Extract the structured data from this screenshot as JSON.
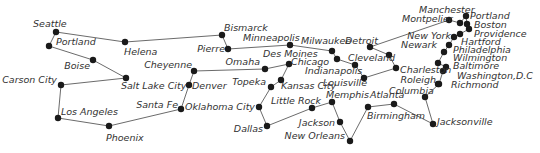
{
  "map": {
    "type": "city-graph",
    "colors": {
      "edge": "#6b6b6b",
      "node": "#1a1a1a",
      "label": "#333333",
      "background": "#ffffff"
    },
    "nodes": [
      {
        "id": "seattle",
        "label": "Seattle",
        "x": 56,
        "y": 32,
        "lx": 33,
        "ly": 27,
        "anchor": "start"
      },
      {
        "id": "portland_or",
        "label": "Portland",
        "x": 49,
        "y": 46,
        "lx": 56,
        "ly": 45,
        "anchor": "start"
      },
      {
        "id": "helena",
        "label": "Helena",
        "x": 125,
        "y": 42,
        "lx": 124,
        "ly": 55,
        "anchor": "start"
      },
      {
        "id": "bismarck",
        "label": "Bismarck",
        "x": 222,
        "y": 35,
        "lx": 224,
        "ly": 31,
        "anchor": "start"
      },
      {
        "id": "pierre",
        "label": "Pierre",
        "x": 228,
        "y": 49,
        "lx": 225,
        "ly": 52,
        "anchor": "end"
      },
      {
        "id": "boise",
        "label": "Boise",
        "x": 93,
        "y": 60,
        "lx": 90,
        "ly": 69,
        "anchor": "end"
      },
      {
        "id": "salt_lake_city",
        "label": "Salt Lake City",
        "x": 126,
        "y": 78,
        "lx": 121,
        "ly": 89,
        "anchor": "start"
      },
      {
        "id": "carson_city",
        "label": "Carson City",
        "x": 61,
        "y": 85,
        "lx": 57,
        "ly": 83,
        "anchor": "end"
      },
      {
        "id": "los_angeles",
        "label": "Los Angeles",
        "x": 58,
        "y": 118,
        "lx": 61,
        "ly": 115,
        "anchor": "start"
      },
      {
        "id": "phoenix",
        "label": "Phoenix",
        "x": 109,
        "y": 126,
        "lx": 106,
        "ly": 141,
        "anchor": "start"
      },
      {
        "id": "santa_fe",
        "label": "Santa Fe",
        "x": 181,
        "y": 109,
        "lx": 178,
        "ly": 108,
        "anchor": "end"
      },
      {
        "id": "denver",
        "label": "Denver",
        "x": 189,
        "y": 85,
        "lx": 192,
        "ly": 89,
        "anchor": "start"
      },
      {
        "id": "cheyenne",
        "label": "Cheyenne",
        "x": 194,
        "y": 71,
        "lx": 192,
        "ly": 68,
        "anchor": "end"
      },
      {
        "id": "omaha",
        "label": "Omaha",
        "x": 265,
        "y": 69,
        "lx": 260,
        "ly": 65,
        "anchor": "end"
      },
      {
        "id": "des_moines",
        "label": "Des Moines",
        "x": 289,
        "y": 64,
        "lx": 263,
        "ly": 57,
        "anchor": "start"
      },
      {
        "id": "topeka",
        "label": "Topeka",
        "x": 271,
        "y": 87,
        "lx": 266,
        "ly": 85,
        "anchor": "end"
      },
      {
        "id": "kansas_city",
        "label": "Kansas City",
        "x": 281,
        "y": 80,
        "lx": 281,
        "ly": 89,
        "anchor": "start"
      },
      {
        "id": "oklahoma_city",
        "label": "Oklahoma City",
        "x": 259,
        "y": 107,
        "lx": 255,
        "ly": 110,
        "anchor": "end"
      },
      {
        "id": "dallas",
        "label": "Dallas",
        "x": 267,
        "y": 126,
        "lx": 263,
        "ly": 132,
        "anchor": "end"
      },
      {
        "id": "little_rock",
        "label": "Little Rock",
        "x": 312,
        "y": 108,
        "lx": 271,
        "ly": 104,
        "anchor": "start"
      },
      {
        "id": "memphis",
        "label": "Memphis",
        "x": 332,
        "y": 102,
        "lx": 326,
        "ly": 98,
        "anchor": "start"
      },
      {
        "id": "jackson",
        "label": "Jackson",
        "x": 340,
        "y": 122,
        "lx": 335,
        "ly": 126,
        "anchor": "end"
      },
      {
        "id": "new_orleans",
        "label": "New Orleans",
        "x": 350,
        "y": 141,
        "lx": 345,
        "ly": 139,
        "anchor": "end"
      },
      {
        "id": "minneapolis",
        "label": "Minneapolis",
        "x": 290,
        "y": 45,
        "lx": 243,
        "ly": 41,
        "anchor": "start"
      },
      {
        "id": "milwaukee",
        "label": "Milwaukee",
        "x": 332,
        "y": 51,
        "lx": 301,
        "ly": 44,
        "anchor": "start"
      },
      {
        "id": "chicago",
        "label": "Chicago",
        "x": 337,
        "y": 59,
        "lx": 291,
        "ly": 65,
        "anchor": "start"
      },
      {
        "id": "indianapolis",
        "label": "Indianapolis",
        "x": 355,
        "y": 65,
        "lx": 305,
        "ly": 74,
        "anchor": "start"
      },
      {
        "id": "louisville",
        "label": "Louisville",
        "x": 364,
        "y": 78,
        "lx": 323,
        "ly": 86,
        "anchor": "start"
      },
      {
        "id": "detroit",
        "label": "Detroit",
        "x": 370,
        "y": 47,
        "lx": 345,
        "ly": 44,
        "anchor": "start"
      },
      {
        "id": "cleveland",
        "label": "Cleveland",
        "x": 389,
        "y": 55,
        "lx": 348,
        "ly": 61,
        "anchor": "start"
      },
      {
        "id": "charleston",
        "label": "Charleston",
        "x": 396,
        "y": 68,
        "lx": 400,
        "ly": 73,
        "anchor": "start"
      },
      {
        "id": "atlanta",
        "label": "Atlanta",
        "x": 368,
        "y": 107,
        "lx": 370,
        "ly": 98,
        "anchor": "start"
      },
      {
        "id": "birmingham",
        "label": "Birmingham",
        "x": 394,
        "y": 104,
        "lx": 367,
        "ly": 119,
        "anchor": "start"
      },
      {
        "id": "columbia",
        "label": "Columbia",
        "x": 425,
        "y": 97,
        "lx": 389,
        "ly": 94,
        "anchor": "start"
      },
      {
        "id": "jacksonville",
        "label": "Jacksonville",
        "x": 433,
        "y": 124,
        "lx": 437,
        "ly": 125,
        "anchor": "start"
      },
      {
        "id": "roleigh",
        "label": "Roleigh",
        "x": 438,
        "y": 84,
        "lx": 436,
        "ly": 83,
        "anchor": "end"
      },
      {
        "id": "richmond",
        "label": "Richmond",
        "x": 439,
        "y": 84,
        "lx": 451,
        "ly": 88,
        "anchor": "start"
      },
      {
        "id": "washington_dc",
        "label": "Washington,D.C",
        "x": 443,
        "y": 71,
        "lx": 457,
        "ly": 79,
        "anchor": "start"
      },
      {
        "id": "baltimore",
        "label": "Baltimore",
        "x": 446,
        "y": 67,
        "lx": 453,
        "ly": 69,
        "anchor": "start"
      },
      {
        "id": "wilmington",
        "label": "Wilmington",
        "x": 438,
        "y": 63,
        "lx": 453,
        "ly": 61,
        "anchor": "start"
      },
      {
        "id": "philadelphia",
        "label": "Philadelphia",
        "x": 444,
        "y": 52,
        "lx": 453,
        "ly": 53,
        "anchor": "start"
      },
      {
        "id": "newark",
        "label": "Newark",
        "x": 449,
        "y": 45,
        "lx": 437,
        "ly": 48,
        "anchor": "end"
      },
      {
        "id": "new_york",
        "label": "New York",
        "x": 454,
        "y": 37,
        "lx": 451,
        "ly": 39,
        "anchor": "end"
      },
      {
        "id": "hartford",
        "label": "Hartford",
        "x": 460,
        "y": 34,
        "lx": 461,
        "ly": 45,
        "anchor": "start"
      },
      {
        "id": "providence",
        "label": "Providence",
        "x": 469,
        "y": 29,
        "lx": 474,
        "ly": 37,
        "anchor": "start"
      },
      {
        "id": "boston",
        "label": "Boston",
        "x": 467,
        "y": 24,
        "lx": 474,
        "ly": 28,
        "anchor": "start"
      },
      {
        "id": "portland_me",
        "label": "Portland",
        "x": 466,
        "y": 16,
        "lx": 470,
        "ly": 19,
        "anchor": "start"
      },
      {
        "id": "manchester",
        "label": "Manchester",
        "x": 460,
        "y": 23,
        "lx": 419,
        "ly": 13,
        "anchor": "start"
      },
      {
        "id": "montpelier",
        "label": "Montpelier",
        "x": 449,
        "y": 20,
        "lx": 402,
        "ly": 22,
        "anchor": "start"
      }
    ],
    "edges": [
      [
        "seattle",
        "portland_or"
      ],
      [
        "seattle",
        "helena"
      ],
      [
        "helena",
        "bismarck"
      ],
      [
        "bismarck",
        "pierre"
      ],
      [
        "pierre",
        "minneapolis"
      ],
      [
        "minneapolis",
        "milwaukee"
      ],
      [
        "milwaukee",
        "chicago"
      ],
      [
        "chicago",
        "indianapolis"
      ],
      [
        "indianapolis",
        "louisville"
      ],
      [
        "louisville",
        "charleston"
      ],
      [
        "charleston",
        "cleveland"
      ],
      [
        "cleveland",
        "detroit"
      ],
      [
        "detroit",
        "montpelier"
      ],
      [
        "montpelier",
        "manchester"
      ],
      [
        "manchester",
        "portland_me"
      ],
      [
        "portland_me",
        "boston"
      ],
      [
        "boston",
        "providence"
      ],
      [
        "providence",
        "hartford"
      ],
      [
        "hartford",
        "new_york"
      ],
      [
        "new_york",
        "newark"
      ],
      [
        "newark",
        "philadelphia"
      ],
      [
        "philadelphia",
        "wilmington"
      ],
      [
        "wilmington",
        "baltimore"
      ],
      [
        "baltimore",
        "washington_dc"
      ],
      [
        "washington_dc",
        "richmond"
      ],
      [
        "richmond",
        "columbia"
      ],
      [
        "columbia",
        "jacksonville"
      ],
      [
        "jacksonville",
        "birmingham"
      ],
      [
        "birmingham",
        "atlanta"
      ],
      [
        "atlanta",
        "new_orleans"
      ],
      [
        "new_orleans",
        "jackson"
      ],
      [
        "jackson",
        "memphis"
      ],
      [
        "memphis",
        "little_rock"
      ],
      [
        "little_rock",
        "dallas"
      ],
      [
        "dallas",
        "oklahoma_city"
      ],
      [
        "oklahoma_city",
        "topeka"
      ],
      [
        "topeka",
        "kansas_city"
      ],
      [
        "kansas_city",
        "des_moines"
      ],
      [
        "des_moines",
        "omaha"
      ],
      [
        "omaha",
        "cheyenne"
      ],
      [
        "cheyenne",
        "denver"
      ],
      [
        "denver",
        "santa_fe"
      ],
      [
        "santa_fe",
        "phoenix"
      ],
      [
        "phoenix",
        "los_angeles"
      ],
      [
        "los_angeles",
        "carson_city"
      ],
      [
        "carson_city",
        "salt_lake_city"
      ],
      [
        "salt_lake_city",
        "boise"
      ],
      [
        "boise",
        "portland_or"
      ]
    ]
  }
}
